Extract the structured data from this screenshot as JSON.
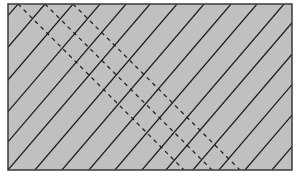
{
  "diagram": {
    "canvas": {
      "width": 297,
      "height": 182,
      "background": "#ffffff"
    },
    "rect": {
      "x": 8,
      "y": 4,
      "width": 284,
      "height": 166,
      "fill": "#c0c0c0",
      "stroke": "#3a3a3a",
      "stroke_width": 1.5
    },
    "solid_lines": {
      "color": "#1a1a1a",
      "width": 1.2,
      "top_offset": 142,
      "bottom_x": [
        -124,
        -97,
        -69,
        -42,
        -16,
        8,
        35,
        62,
        89,
        115,
        142,
        166,
        193,
        219,
        245,
        272
      ]
    },
    "dashed_lines": {
      "color": "#1a1a1a",
      "width": 1.2,
      "dash": "4,4",
      "segments": [
        {
          "x1": 18,
          "y1": 4,
          "x2": 184,
          "y2": 170
        },
        {
          "x1": 45,
          "y1": 4,
          "x2": 212,
          "y2": 170
        },
        {
          "x1": 73,
          "y1": 4,
          "x2": 240,
          "y2": 170
        }
      ]
    }
  }
}
